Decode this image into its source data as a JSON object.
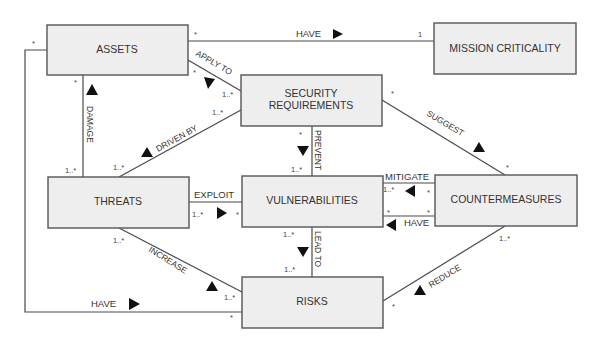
{
  "diagram": {
    "boxes": {
      "assets": {
        "label": "ASSETS"
      },
      "mission_criticality": {
        "label": "MISSION CRITICALITY"
      },
      "security_requirements": {
        "line1": "SECURITY",
        "line2": "REQUIREMENTS"
      },
      "threats": {
        "label": "THREATS"
      },
      "vulnerabilities": {
        "label": "VULNERABILITIES"
      },
      "countermeasures": {
        "label": "COUNTERMEASURES"
      },
      "risks": {
        "label": "RISKS"
      }
    },
    "relations": {
      "assets_have_mission": {
        "label": "HAVE",
        "mult_source": "*",
        "mult_target": "1"
      },
      "apply_to": {
        "label": "APPLY TO",
        "mult_source": "*",
        "mult_target": "1..*"
      },
      "damage": {
        "label": "DAMAGE",
        "mult_assets": "*",
        "mult_threats": "1..*"
      },
      "driven_by": {
        "label": "DRIVEN BY",
        "mult_threats": "1..*",
        "mult_secreq": "1..*"
      },
      "suggest": {
        "label": "SUGGEST",
        "mult_secreq": "*",
        "mult_counter": "*"
      },
      "prevent": {
        "label": "PREVENT",
        "mult_secreq": "*",
        "mult_vuln": "1..*"
      },
      "exploit": {
        "label": "EXPLOIT",
        "mult_threats": "1..*",
        "mult_vuln": "*"
      },
      "mitigate": {
        "label": "MITIGATE",
        "mult_vuln": "1..*",
        "mult_counter": "*"
      },
      "counter_have_vuln": {
        "label": "HAVE",
        "mult_vuln": "*",
        "mult_counter": "*"
      },
      "lead_to": {
        "label": "LEAD TO",
        "mult_vuln": "1..*",
        "mult_risks": "1..*"
      },
      "increase": {
        "label": "INCREASE",
        "mult_threats": "1..*",
        "mult_risks": "1..*"
      },
      "reduce": {
        "label": "REDUCE",
        "mult_risks": "*",
        "mult_counter": "1..*"
      },
      "assets_have_risks": {
        "label": "HAVE",
        "mult_assets": "*",
        "mult_risks": "*"
      }
    }
  }
}
